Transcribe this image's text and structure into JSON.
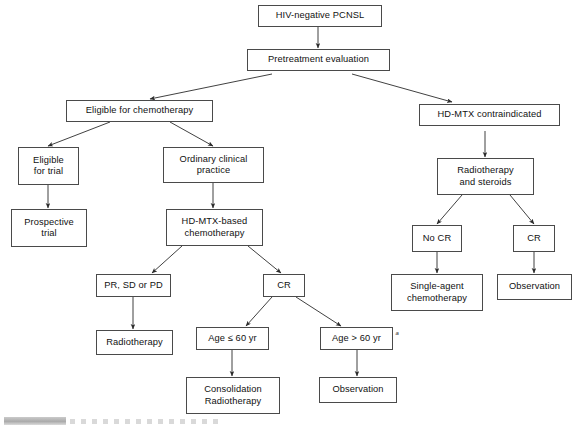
{
  "diagram": {
    "type": "flowchart",
    "background_color": "#ffffff",
    "box_border_color": "#4a4a4a",
    "text_color": "#111111",
    "footnote_marker": "a",
    "nodes": [
      {
        "id": "hiv_negative_pcnsl",
        "label": "HIV-negative PCNSL"
      },
      {
        "id": "pretreatment_evaluation",
        "label": "Pretreatment evaluation"
      },
      {
        "id": "eligible_for_chemotherapy",
        "label": "Eligible for chemotherapy"
      },
      {
        "id": "hd_mtx_contraindicated",
        "label": "HD-MTX contraindicated"
      },
      {
        "id": "eligible_for_trial",
        "label": "Eligible\nfor trial"
      },
      {
        "id": "ordinary_clinical_practice",
        "label": "Ordinary clinical\npractice"
      },
      {
        "id": "radiotherapy_and_steroids",
        "label": "Radiotherapy\nand steroids"
      },
      {
        "id": "prospective_trial",
        "label": "Prospective\ntrial"
      },
      {
        "id": "hd_mtx_based_chemotherapy",
        "label": "HD-MTX-based\nchemotherapy"
      },
      {
        "id": "no_cr",
        "label": "No CR"
      },
      {
        "id": "cr_right",
        "label": "CR"
      },
      {
        "id": "pr_sd_or_pd",
        "label": "PR, SD or PD"
      },
      {
        "id": "cr_center",
        "label": "CR"
      },
      {
        "id": "single_agent_chemotherapy",
        "label": "Single-agent\nchemotherapy"
      },
      {
        "id": "observation_right",
        "label": "Observation"
      },
      {
        "id": "radiotherapy_left",
        "label": "Radiotherapy"
      },
      {
        "id": "age_le_60",
        "label": "Age ≤ 60 yr"
      },
      {
        "id": "age_gt_60",
        "label": "Age > 60 yr"
      },
      {
        "id": "consolidation_radiotherapy",
        "label": "Consolidation\nRadiotherapy"
      },
      {
        "id": "observation_center",
        "label": "Observation"
      }
    ],
    "edges": [
      {
        "from": "hiv_negative_pcnsl",
        "to": "pretreatment_evaluation"
      },
      {
        "from": "pretreatment_evaluation",
        "to": "eligible_for_chemotherapy"
      },
      {
        "from": "pretreatment_evaluation",
        "to": "hd_mtx_contraindicated"
      },
      {
        "from": "eligible_for_chemotherapy",
        "to": "eligible_for_trial"
      },
      {
        "from": "eligible_for_chemotherapy",
        "to": "ordinary_clinical_practice"
      },
      {
        "from": "eligible_for_trial",
        "to": "prospective_trial"
      },
      {
        "from": "ordinary_clinical_practice",
        "to": "hd_mtx_based_chemotherapy"
      },
      {
        "from": "hd_mtx_contraindicated",
        "to": "radiotherapy_and_steroids"
      },
      {
        "from": "radiotherapy_and_steroids",
        "to": "no_cr"
      },
      {
        "from": "radiotherapy_and_steroids",
        "to": "cr_right"
      },
      {
        "from": "no_cr",
        "to": "single_agent_chemotherapy"
      },
      {
        "from": "cr_right",
        "to": "observation_right"
      },
      {
        "from": "hd_mtx_based_chemotherapy",
        "to": "pr_sd_or_pd"
      },
      {
        "from": "hd_mtx_based_chemotherapy",
        "to": "cr_center"
      },
      {
        "from": "pr_sd_or_pd",
        "to": "radiotherapy_left"
      },
      {
        "from": "cr_center",
        "to": "age_le_60"
      },
      {
        "from": "cr_center",
        "to": "age_gt_60"
      },
      {
        "from": "age_le_60",
        "to": "consolidation_radiotherapy"
      },
      {
        "from": "age_gt_60",
        "to": "observation_center"
      }
    ]
  }
}
